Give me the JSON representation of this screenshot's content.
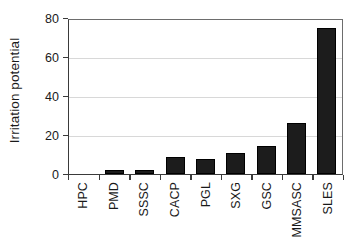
{
  "chart_data": {
    "type": "bar",
    "title": "",
    "xlabel": "",
    "ylabel": "Irritation potential",
    "categories": [
      "HPC",
      "PMD",
      "SSSC",
      "CACP",
      "PGL",
      "SXG",
      "GSC",
      "MMSASC",
      "SLES"
    ],
    "values": [
      0,
      2,
      2,
      9,
      8,
      11,
      14.5,
      26.5,
      75.5
    ],
    "ylim": [
      0,
      80
    ],
    "yticks": [
      0,
      20,
      40,
      60,
      80
    ],
    "ytick_labels": [
      "0",
      "20",
      "40",
      "60",
      "80"
    ],
    "grid": true,
    "legend": false,
    "bar_color": "#1c1c1c",
    "axis_color": "#3a3a3a",
    "grid_color": "#d8d8d8",
    "background": "#ffffff"
  }
}
